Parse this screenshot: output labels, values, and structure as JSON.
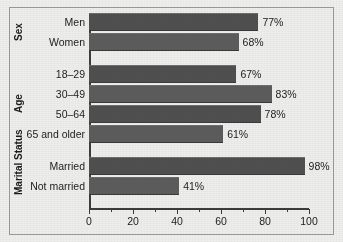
{
  "chart_data": {
    "type": "bar",
    "orientation": "horizontal",
    "title": "",
    "subtitle": "",
    "xlabel": "",
    "ylabel": "",
    "xlim": [
      0,
      100
    ],
    "grid": false,
    "legend": "none",
    "xticks": [
      0,
      20,
      40,
      60,
      80,
      100
    ],
    "xtick_labels": [
      "0",
      "20",
      "40",
      "60",
      "80",
      "100"
    ],
    "minor_xticks": [
      10,
      30,
      50,
      70,
      90
    ],
    "value_suffix": "%",
    "bar_color": "#4f4f4f",
    "background_color": "#ededeb",
    "axis_color": "#3c3c3c",
    "groups": [
      {
        "name": "Sex",
        "categories": [
          "Men",
          "Women"
        ],
        "values": [
          77,
          68
        ],
        "value_labels": [
          "77%",
          "68%"
        ]
      },
      {
        "name": "Age",
        "categories": [
          "18–29",
          "30–49",
          "50–64",
          "65 and older"
        ],
        "values": [
          67,
          83,
          78,
          61
        ],
        "value_labels": [
          "67%",
          "83%",
          "78%",
          "61%"
        ]
      },
      {
        "name": "Marital Status",
        "categories": [
          "Married",
          "Not married"
        ],
        "values": [
          98,
          41
        ],
        "value_labels": [
          "98%",
          "41%"
        ]
      }
    ],
    "categories": [
      "Men",
      "Women",
      "18–29",
      "30–49",
      "50–64",
      "65 and older",
      "Married",
      "Not married"
    ],
    "values": [
      77,
      68,
      67,
      83,
      78,
      61,
      98,
      41
    ]
  }
}
